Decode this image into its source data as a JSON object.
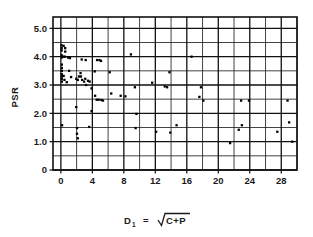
{
  "chart_data": {
    "type": "scatter",
    "title": "",
    "xlabel": "D₁  =  √(C+P)",
    "xlabel_parts": {
      "symbol": "D",
      "subscript": "1",
      "equals": "=",
      "radicand": "C+P"
    },
    "ylabel": "PSR",
    "xlim": [
      -1,
      30
    ],
    "ylim": [
      0,
      5.4
    ],
    "xticks": [
      0,
      4,
      8,
      12,
      16,
      20,
      24,
      28
    ],
    "xtick_labels": [
      "0",
      "4",
      "8",
      "12",
      "16",
      "20",
      "24",
      "28"
    ],
    "yticks": [
      0,
      1.0,
      2.0,
      3.0,
      4.0,
      5.0
    ],
    "ytick_labels": [
      "0",
      "1.0",
      "2.0",
      "3.0",
      "4.0",
      "5.0"
    ],
    "grid": true,
    "grid_x_major_step": 4,
    "grid_x_minor_step": 2,
    "grid_y_major_step": 1.0,
    "grid_y_minor_step": 0.5,
    "legend": null,
    "marker": "square",
    "marker_color": "#000000",
    "points": [
      [
        0.1,
        4.4
      ],
      [
        0.35,
        4.38
      ],
      [
        0.1,
        4.3
      ],
      [
        0.1,
        4.22
      ],
      [
        0.55,
        4.3
      ],
      [
        0.55,
        4.18
      ],
      [
        0.1,
        4.05
      ],
      [
        0.1,
        3.97
      ],
      [
        0.3,
        4.0
      ],
      [
        0.5,
        4.0
      ],
      [
        0.9,
        3.97
      ],
      [
        1.15,
        3.95
      ],
      [
        0.12,
        3.72
      ],
      [
        0.12,
        3.6
      ],
      [
        0.12,
        3.5
      ],
      [
        0.12,
        3.38
      ],
      [
        0.12,
        3.3
      ],
      [
        0.35,
        3.32
      ],
      [
        0.12,
        3.22
      ],
      [
        0.12,
        3.12
      ],
      [
        0.45,
        3.18
      ],
      [
        0.75,
        3.1
      ],
      [
        1.05,
        3.5
      ],
      [
        1.3,
        3.28
      ],
      [
        1.95,
        3.22
      ],
      [
        2.15,
        3.18
      ],
      [
        2.3,
        3.3
      ],
      [
        2.5,
        3.42
      ],
      [
        2.55,
        3.3
      ],
      [
        2.7,
        3.18
      ],
      [
        2.95,
        3.12
      ],
      [
        3.1,
        3.22
      ],
      [
        3.2,
        3.0
      ],
      [
        3.45,
        3.15
      ],
      [
        3.65,
        3.12
      ],
      [
        2.65,
        3.9
      ],
      [
        3.15,
        3.88
      ],
      [
        4.6,
        3.88
      ],
      [
        4.9,
        3.88
      ],
      [
        5.1,
        3.85
      ],
      [
        4.3,
        3.48
      ],
      [
        3.9,
        2.88
      ],
      [
        4.35,
        2.62
      ],
      [
        4.55,
        2.48
      ],
      [
        4.8,
        2.48
      ],
      [
        5.15,
        2.47
      ],
      [
        5.35,
        2.45
      ],
      [
        1.95,
        2.22
      ],
      [
        2.05,
        1.48
      ],
      [
        2.05,
        1.28
      ],
      [
        2.15,
        1.12
      ],
      [
        3.6,
        1.52
      ],
      [
        3.9,
        2.08
      ],
      [
        0.15,
        1.58
      ],
      [
        6.4,
        2.7
      ],
      [
        7.6,
        2.62
      ],
      [
        8.2,
        2.6
      ],
      [
        6.2,
        3.45
      ],
      [
        8.9,
        4.08
      ],
      [
        9.4,
        2.92
      ],
      [
        9.6,
        1.98
      ],
      [
        9.5,
        1.48
      ],
      [
        11.6,
        3.08
      ],
      [
        12.1,
        1.35
      ],
      [
        13.2,
        2.95
      ],
      [
        13.5,
        2.92
      ],
      [
        13.8,
        3.45
      ],
      [
        13.9,
        1.32
      ],
      [
        14.7,
        1.58
      ],
      [
        16.6,
        4.0
      ],
      [
        17.8,
        2.92
      ],
      [
        17.6,
        2.58
      ],
      [
        18.1,
        2.45
      ],
      [
        21.5,
        0.95
      ],
      [
        22.6,
        1.42
      ],
      [
        22.9,
        2.45
      ],
      [
        23.0,
        1.58
      ],
      [
        23.9,
        2.45
      ],
      [
        27.5,
        1.35
      ],
      [
        28.8,
        2.45
      ],
      [
        29.0,
        1.68
      ],
      [
        29.4,
        1.0
      ]
    ]
  },
  "axis_labels": {
    "y_title": "PSR",
    "x_symbol": "D",
    "x_subscript": "1",
    "x_equals": "=",
    "x_radicand": "C+P"
  }
}
